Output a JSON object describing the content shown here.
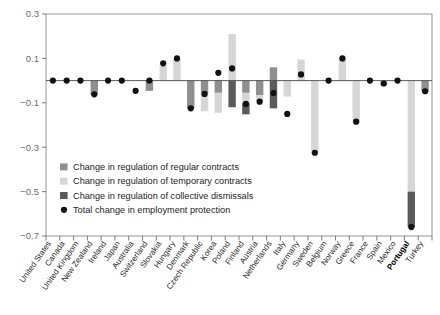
{
  "chart_data": {
    "type": "bar",
    "title": "",
    "subtitle": "",
    "xlabel": "",
    "ylabel": "",
    "ylim": [
      -0.7,
      0.3
    ],
    "yticks": [
      0.3,
      0.1,
      -0.1,
      -0.3,
      -0.5,
      -0.7
    ],
    "ytick_labels": [
      "0.3",
      "0.1",
      "−0.1",
      "−0.3",
      "−0.5",
      "−0.7"
    ],
    "grid": false,
    "stacked": true,
    "legend_position": "inside-lower-left",
    "bold_categories": [
      "Portugal"
    ],
    "categories": [
      "United States",
      "Canada",
      "United Kingdom",
      "New Zealand",
      "Ireland",
      "Japan",
      "Australia",
      "Switzerland",
      "Slovakia",
      "Hungary",
      "Denmark",
      "Czech Republic",
      "Korea",
      "Poland",
      "Finland",
      "Austria",
      "Netherlands",
      "Italy",
      "Germany",
      "Sweden",
      "Belgium",
      "Norway",
      "Greece",
      "France",
      "Spain",
      "Mexico",
      "Portugal",
      "Turkey"
    ],
    "series": [
      {
        "name": "Change in regulation of regular contracts",
        "color": "#8f8f8f",
        "values": [
          0,
          0,
          0,
          -0.062,
          0,
          0,
          0,
          -0.046,
          0,
          0,
          -0.125,
          -0.06,
          -0.055,
          0,
          -0.055,
          -0.065,
          0.06,
          0,
          0,
          0,
          0,
          0,
          0,
          0,
          0,
          0,
          0,
          -0.048
        ]
      },
      {
        "name": "Change in regulation of temporary contracts",
        "color": "#d6d6d6",
        "values": [
          0,
          0,
          0,
          0,
          0,
          0,
          0,
          0,
          0.068,
          0.098,
          0,
          -0.078,
          -0.09,
          0.21,
          -0.047,
          -0.03,
          0,
          -0.072,
          0.095,
          -0.325,
          0,
          0.1,
          -0.185,
          0,
          -0.023,
          0,
          -0.5,
          0
        ]
      },
      {
        "name": "Change in regulation of collective dismissals",
        "color": "#5a5a5a",
        "values": [
          0,
          0,
          0,
          0,
          0,
          0,
          0,
          0,
          0,
          0,
          0,
          0,
          0,
          -0.12,
          -0.05,
          0,
          -0.125,
          0,
          0,
          0,
          0,
          0,
          0,
          0,
          0,
          0,
          -0.16,
          0
        ]
      }
    ],
    "total_series": {
      "name": "Total change in employment protection",
      "marker": "circle",
      "color": "#111111",
      "values": [
        0,
        0,
        0,
        -0.062,
        0,
        0,
        -0.046,
        0,
        0.078,
        0.1,
        -0.125,
        -0.06,
        0.035,
        0.055,
        -0.105,
        -0.095,
        -0.056,
        -0.15,
        0.028,
        -0.325,
        0,
        0.1,
        -0.185,
        0,
        -0.013,
        0,
        -0.66,
        -0.048
      ]
    }
  },
  "legend": {
    "items": [
      {
        "label": "Change in regulation of regular contracts",
        "swatch": "#8f8f8f",
        "shape": "square"
      },
      {
        "label": "Change in regulation of temporary contracts",
        "swatch": "#d6d6d6",
        "shape": "square"
      },
      {
        "label": "Change in regulation of collective dismissals",
        "swatch": "#5a5a5a",
        "shape": "square"
      },
      {
        "label": "Total change in employment protection",
        "swatch": "#111111",
        "shape": "circle"
      }
    ]
  }
}
